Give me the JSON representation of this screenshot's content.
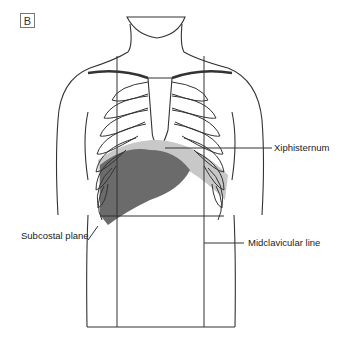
{
  "figure": {
    "panel_label": "B",
    "labels": {
      "xiphisternum": "Xiphisternum",
      "subcostal_plane": "Subcostal plane",
      "midclavicular_line": "Midclavicular line"
    },
    "colors": {
      "outline": "#333333",
      "liver": "#6b6b6b",
      "diaphragm_shade": "#c8c8c8",
      "background": "#ffffff"
    }
  }
}
